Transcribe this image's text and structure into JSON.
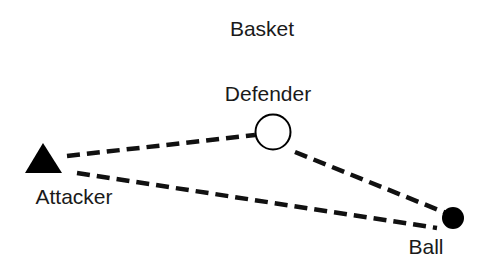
{
  "diagram": {
    "labels": {
      "basket": "Basket",
      "defender": "Defender",
      "attacker": "Attacker",
      "ball": "Ball"
    },
    "nodes": [
      {
        "id": "attacker",
        "shape": "filled-triangle",
        "color": "#000000"
      },
      {
        "id": "defender",
        "shape": "hollow-circle",
        "color": "#000000"
      },
      {
        "id": "ball",
        "shape": "filled-circle",
        "color": "#000000"
      }
    ],
    "edges": [
      {
        "from": "attacker",
        "to": "defender",
        "style": "dashed"
      },
      {
        "from": "defender",
        "to": "ball",
        "style": "dashed"
      },
      {
        "from": "attacker",
        "to": "ball",
        "style": "dashed"
      }
    ]
  }
}
